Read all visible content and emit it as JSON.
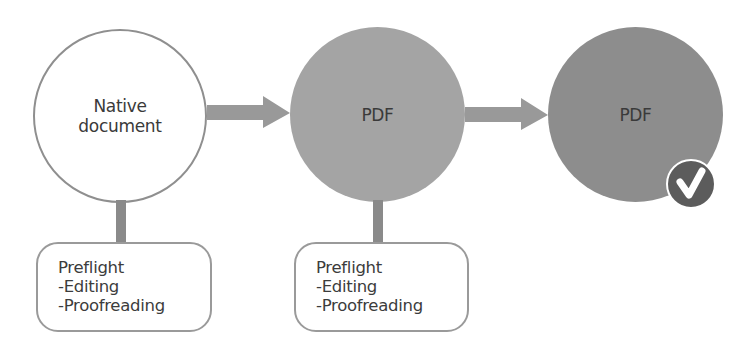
{
  "diagram": {
    "nodes": [
      {
        "id": "native",
        "label_lines": [
          "Native",
          "document"
        ],
        "fill": "#ffffff",
        "stroke": "#8f8f8f"
      },
      {
        "id": "pdf1",
        "label": "PDF",
        "fill": "#a4a4a4"
      },
      {
        "id": "pdf2",
        "label": "PDF",
        "fill": "#8d8d8d",
        "badge": "check-icon",
        "badge_color": "#5c5c5c"
      }
    ],
    "arrows": [
      {
        "from": "native",
        "to": "pdf1",
        "color": "#999999"
      },
      {
        "from": "pdf1",
        "to": "pdf2",
        "color": "#999999"
      }
    ],
    "notes": [
      {
        "attached_to": "native",
        "lines": [
          "Preflight",
          "-Editing",
          "-Proofreading"
        ]
      },
      {
        "attached_to": "pdf1",
        "lines": [
          "Preflight",
          "-Editing",
          "-Proofreading"
        ]
      }
    ]
  }
}
